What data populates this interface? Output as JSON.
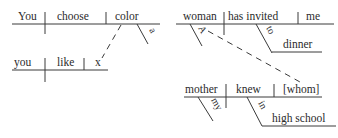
{
  "diagram1": {
    "main_clause": {
      "subject": "You",
      "verb": "choose",
      "object": "color",
      "modifier": "a"
    },
    "relative_clause": {
      "subject": "you",
      "verb": "like",
      "object": "x"
    }
  },
  "diagram2": {
    "main_clause": {
      "subject": "woman",
      "verb": "has invited",
      "object": "me",
      "subject_modifier": "A",
      "preposition": "to",
      "prep_object": "dinner"
    },
    "relative_clause": {
      "subject": "mother",
      "verb": "knew",
      "object": "[whom]",
      "subject_modifier": "my",
      "preposition": "in",
      "prep_object": "high school"
    }
  },
  "colors": {
    "ink": "#2b2b2b",
    "background": "#ffffff"
  }
}
